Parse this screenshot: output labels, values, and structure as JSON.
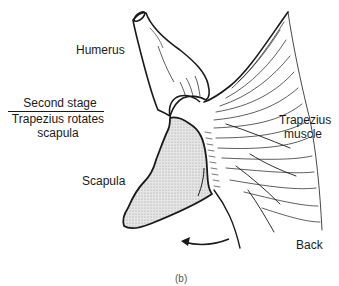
{
  "figure": {
    "panel_label": "(b)",
    "labels": {
      "humerus": "Humerus",
      "stage_title": "Second stage",
      "stage_line1": "Trapezius rotates",
      "stage_line2": "scapula",
      "trapezius": "Trapezius",
      "trapezius_2": "muscle",
      "scapula": "Scapula",
      "back": "Back"
    },
    "colors": {
      "ink": "#1a1a1a",
      "scapula_fill": "#d9d9d9",
      "background": "#ffffff"
    },
    "annotations": {
      "rotation_arrow": "counter-clockwise arrow indicating scapula rotation"
    }
  }
}
